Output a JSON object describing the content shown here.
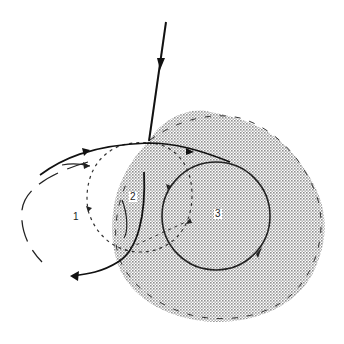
{
  "diagram": {
    "type": "trajectory diagram",
    "shaded_region": {
      "pattern": "dot-stipple",
      "color": "#8a8a8a",
      "description": "irregular shaded (stippled) region around circle 3 with dashed outline"
    },
    "labels": [
      {
        "id": "1",
        "text": "1"
      },
      {
        "id": "2",
        "text": "2"
      },
      {
        "id": "3",
        "text": "3"
      }
    ],
    "elements": [
      {
        "name": "incoming-line",
        "style": "solid",
        "arrow": "downward"
      },
      {
        "name": "outer-trajectory",
        "style": "solid",
        "arrow": "exit lower-left"
      },
      {
        "name": "circle-1",
        "style": "long-dash",
        "label": "1"
      },
      {
        "name": "circle-2",
        "style": "short-dash",
        "label": "2"
      },
      {
        "name": "circle-3",
        "style": "solid",
        "label": "3",
        "arrow": "clockwise"
      },
      {
        "name": "region-boundary",
        "style": "long-dash"
      }
    ]
  }
}
